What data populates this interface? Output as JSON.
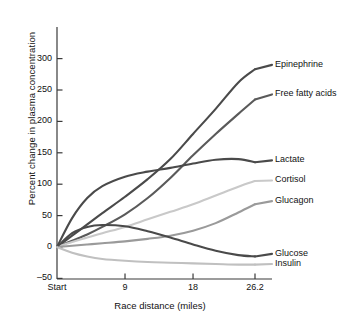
{
  "chart_data": {
    "type": "line",
    "title": "",
    "xlabel": "Race distance (miles)",
    "ylabel": "Percent change in plasma concentration",
    "xlim": [
      0,
      26.2
    ],
    "ylim": [
      -50,
      300
    ],
    "ytick_values": [
      300,
      250,
      200,
      150,
      100,
      50,
      0,
      -50
    ],
    "ytick_labels": [
      "300",
      "250",
      "200",
      "150",
      "100",
      "50",
      "0",
      "–50"
    ],
    "xtick_values": [
      0,
      9,
      18,
      26.2
    ],
    "xtick_labels": [
      "Start",
      "9",
      "18",
      "26.2"
    ],
    "grid": false,
    "legend_position": "right-inline-labels",
    "x": [
      0,
      2,
      4,
      6,
      9,
      12,
      15,
      18,
      21,
      24,
      26.2
    ],
    "series": [
      {
        "name": "Epinephrine",
        "color": "#4a4a4a",
        "label_y_percent": 290,
        "values": [
          0,
          18,
          36,
          54,
          80,
          108,
          140,
          180,
          220,
          262,
          283
        ]
      },
      {
        "name": "Free fatty acids",
        "color": "#5a5a5a",
        "label_y_percent": 243,
        "values": [
          0,
          10,
          20,
          32,
          52,
          78,
          110,
          146,
          180,
          212,
          235
        ]
      },
      {
        "name": "Lactate",
        "color": "#4a4a4a",
        "label_y_percent": 138,
        "values": [
          0,
          46,
          78,
          97,
          112,
          120,
          126,
          133,
          139,
          140,
          135
        ]
      },
      {
        "name": "Cortisol",
        "color": "#c9c9c9",
        "label_y_percent": 106,
        "values": [
          0,
          8,
          15,
          22,
          32,
          44,
          56,
          68,
          82,
          96,
          105
        ]
      },
      {
        "name": "Glucagon",
        "color": "#9a9a9a",
        "label_y_percent": 73,
        "values": [
          0,
          2,
          4,
          6,
          9,
          13,
          18,
          26,
          38,
          55,
          68
        ]
      },
      {
        "name": "Glucose",
        "color": "#4a4a4a",
        "label_y_percent": -11,
        "values": [
          0,
          22,
          32,
          35,
          33,
          25,
          15,
          4,
          -6,
          -13,
          -15
        ]
      },
      {
        "name": "Insulin",
        "color": "#c0c0c0",
        "label_y_percent": -27,
        "values": [
          0,
          -9,
          -15,
          -19,
          -22,
          -24,
          -25,
          -26,
          -27,
          -28,
          -28
        ]
      }
    ]
  },
  "axis": {
    "y_title": "Percent change in plasma concentration",
    "x_title": "Race distance (miles)"
  },
  "ticks": {
    "y": [
      "300",
      "250",
      "200",
      "150",
      "100",
      "50",
      "0",
      "–50"
    ],
    "x": [
      "Start",
      "9",
      "18",
      "26.2"
    ]
  },
  "labels": {
    "s0": "Epinephrine",
    "s1": "Free fatty acids",
    "s2": "Lactate",
    "s3": "Cortisol",
    "s4": "Glucagon",
    "s5": "Glucose",
    "s6": "Insulin"
  },
  "colors": {
    "axis": "#3a3a3a",
    "text": "#111111",
    "background": "#ffffff"
  }
}
